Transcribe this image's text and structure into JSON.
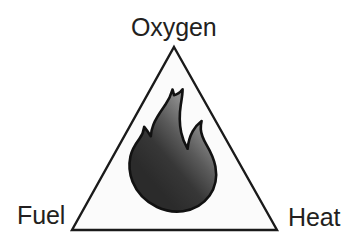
{
  "diagram": {
    "type": "triangle-diagram",
    "background_color": "#ffffff",
    "triangle": {
      "name": "fire-triangle",
      "stroke_color": "#1a1a1a",
      "stroke_width": 2.4,
      "fill_color": "#fbfbfb",
      "apex": {
        "x": 174,
        "y": 47
      },
      "bottom_left": {
        "x": 72,
        "y": 230
      },
      "bottom_right": {
        "x": 277,
        "y": 230
      }
    },
    "flame": {
      "name": "flame-icon",
      "outline_color": "#111111",
      "gradient_light": "#8c8c8c",
      "gradient_dark": "#2b2b2b",
      "bounds": {
        "x": 130,
        "y": 89,
        "width": 85,
        "height": 124
      }
    },
    "labels": {
      "top": "Oxygen",
      "bottom_left": "Fuel",
      "bottom_right": "Heat"
    },
    "label_color": "#231f20"
  }
}
